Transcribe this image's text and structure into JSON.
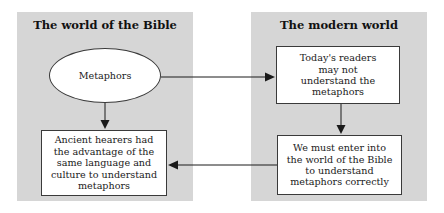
{
  "diagram": {
    "panels": [
      {
        "id": "bible",
        "title": "The world of the Bible"
      },
      {
        "id": "modern",
        "title": "The modern world"
      }
    ],
    "nodes": {
      "metaphors": "Metaphors",
      "ancient_hearers": "Ancient hearers had the advantage of the same language and culture to understand metaphors",
      "todays_readers": "Today's readers may not understand the metaphors",
      "enter_world": "We must enter into the world of the Bible to understand metaphors correctly"
    },
    "edges": [
      {
        "from": "metaphors",
        "to": "todays_readers",
        "direction": "right"
      },
      {
        "from": "metaphors",
        "to": "ancient_hearers",
        "direction": "down"
      },
      {
        "from": "todays_readers",
        "to": "enter_world",
        "direction": "down"
      },
      {
        "from": "enter_world",
        "to": "ancient_hearers",
        "direction": "left"
      }
    ],
    "colors": {
      "panel_bg": "#d6d6d6",
      "node_bg": "#ffffff",
      "line": "#1a1a1a"
    }
  }
}
